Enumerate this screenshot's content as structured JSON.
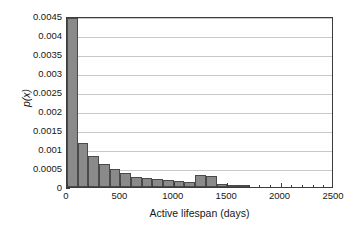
{
  "chart_data": {
    "type": "bar",
    "title": "",
    "subtitle": "",
    "xlabel": "Active lifespan (days)",
    "ylabel": "p(x)",
    "xlim": [
      0,
      2500
    ],
    "ylim": [
      0,
      0.0045
    ],
    "grid": "horizontal",
    "legend": "none",
    "bin_width": 100,
    "bar_color": "#8a8a8a",
    "bar_edge_color": "#4a4a4a",
    "grid_color": "#c9c9c9",
    "axis_color": "#3c3c3c",
    "xticks": [
      0,
      500,
      1000,
      1500,
      2000,
      2500
    ],
    "xtick_labels": [
      "0",
      "500",
      "1000",
      "1500",
      "2000",
      "2500"
    ],
    "xminor_tick_step": 100,
    "yticks": [
      0,
      0.0005,
      0.001,
      0.0015,
      0.002,
      0.0025,
      0.003,
      0.0035,
      0.004,
      0.0045
    ],
    "ytick_labels": [
      "0",
      "0.0005",
      "0.001",
      "0.0015",
      "0.002",
      "0.0025",
      "0.003",
      "0.0035",
      "0.004",
      "0.0045"
    ],
    "bin_starts": [
      0,
      100,
      200,
      300,
      400,
      500,
      600,
      700,
      800,
      900,
      1000,
      1100,
      1200,
      1300,
      1400,
      1500,
      1600
    ],
    "categories": [
      "0-100",
      "100-200",
      "200-300",
      "300-400",
      "400-500",
      "500-600",
      "600-700",
      "700-800",
      "800-900",
      "900-1000",
      "1000-1100",
      "1100-1200",
      "1200-1300",
      "1300-1400",
      "1400-1500",
      "1500-1600",
      "1600-1700"
    ],
    "values": [
      0.00445,
      0.00115,
      0.00082,
      0.0006,
      0.00048,
      0.00037,
      0.00026,
      0.00023,
      0.00022,
      0.00018,
      0.00015,
      0.00013,
      0.00031,
      0.0003,
      8e-05,
      4e-05,
      2e-05
    ]
  }
}
